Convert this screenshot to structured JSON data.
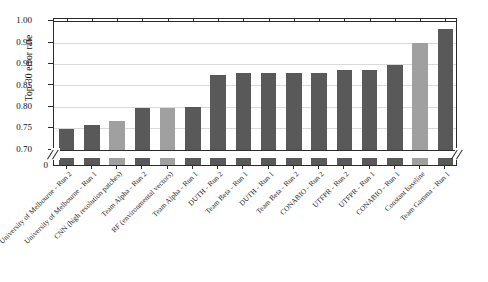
{
  "chart_data": {
    "type": "bar",
    "title": "",
    "xlabel": "",
    "ylabel": "Top-30 error rate",
    "ylim": [
      0.0,
      1.0
    ],
    "axis_break": {
      "present": true,
      "below": 0.7,
      "zero_tick": "0"
    },
    "grid": true,
    "legend": "none",
    "ytick_labels": [
      "0.70",
      "0.75",
      "0.80",
      "0.85",
      "0.90",
      "0.95",
      "1.00"
    ],
    "ytick_values": [
      0.7,
      0.75,
      0.8,
      0.85,
      0.9,
      0.95,
      1.0
    ],
    "categories": [
      "University of Melbourne - Run 2",
      "University of Melbourne - Run 1",
      "CNN (high resolution patches)",
      "Team Alpha - Run 2",
      "RF (environmental vectors)",
      "Team Alpha - Run 1",
      "DUTH - Run 2",
      "Team Beta - Run 1",
      "DUTH - Run 1",
      "Team Beta - Run 2",
      "CONABIO - Run 2",
      "UTFPR - Run 2",
      "UTFPR - Run 1",
      "CONABIO - Run 1",
      "Constant baseline",
      "Team Gamma - Run 1"
    ],
    "values": [
      0.748,
      0.757,
      0.767,
      0.797,
      0.797,
      0.8,
      0.875,
      0.88,
      0.88,
      0.88,
      0.88,
      0.885,
      0.887,
      0.897,
      0.95,
      0.982
    ],
    "bar_styles": [
      "dark",
      "dark",
      "light",
      "dark",
      "light",
      "dark",
      "dark",
      "dark",
      "dark",
      "dark",
      "dark",
      "dark",
      "dark",
      "dark",
      "light",
      "dark"
    ],
    "colors": {
      "bar_dark": "#595959",
      "bar_light": "#a0a0a0",
      "grid": "#d9d9d9",
      "axis": "#2b2b2b",
      "background": "#ffffff"
    }
  }
}
